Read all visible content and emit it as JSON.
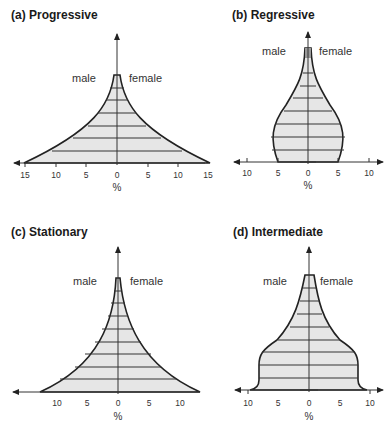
{
  "figure": {
    "panels": [
      {
        "id": "a",
        "title": "(a) Progressive",
        "male_label": "male",
        "female_label": "female",
        "x_ticks": [
          "15",
          "10",
          "5",
          "0",
          "5",
          "10",
          "15"
        ],
        "unit": "%"
      },
      {
        "id": "b",
        "title": "(b) Regressive",
        "male_label": "male",
        "female_label": "female",
        "x_ticks": [
          "10",
          "5",
          "0",
          "5",
          "10"
        ],
        "unit": "%"
      },
      {
        "id": "c",
        "title": "(c) Stationary",
        "male_label": "male",
        "female_label": "female",
        "x_ticks": [
          "10",
          "5",
          "0",
          "5",
          "10"
        ],
        "unit": "%"
      },
      {
        "id": "d",
        "title": "(d) Intermediate",
        "male_label": "male",
        "female_label": "female",
        "x_ticks": [
          "10",
          "5",
          "0",
          "5",
          "10"
        ],
        "unit": "%"
      }
    ],
    "colors": {
      "fill": "#e6e6e6",
      "outline": "#222222",
      "axis": "#333333"
    }
  }
}
